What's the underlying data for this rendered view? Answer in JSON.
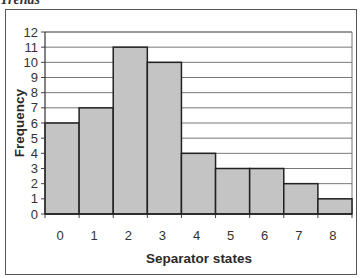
{
  "header": {
    "clipped_title": "Trends"
  },
  "chart_data": {
    "type": "bar",
    "title": "",
    "xlabel": "Separator states",
    "ylabel": "Frequency",
    "categories": [
      "0",
      "1",
      "2",
      "3",
      "4",
      "5",
      "6",
      "7",
      "8"
    ],
    "values": [
      6,
      7,
      11,
      10,
      4,
      3,
      3,
      2,
      1
    ],
    "ylim": [
      0,
      12
    ],
    "yticks": [
      "0",
      "1",
      "2",
      "3",
      "4",
      "5",
      "6",
      "7",
      "8",
      "9",
      "10",
      "11",
      "12"
    ],
    "grid": true,
    "legend": null,
    "bar_color": "#c4c4c4",
    "bar_edge_color": "#222222",
    "grid_color": "#777777"
  }
}
